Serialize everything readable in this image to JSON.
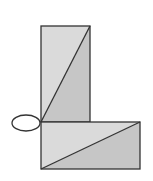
{
  "diagram": {
    "colors": {
      "stroke": "#333333",
      "light_fill": "#d9d9d9",
      "dark_fill": "#c4c4c4",
      "background": "#ffffff"
    }
  }
}
